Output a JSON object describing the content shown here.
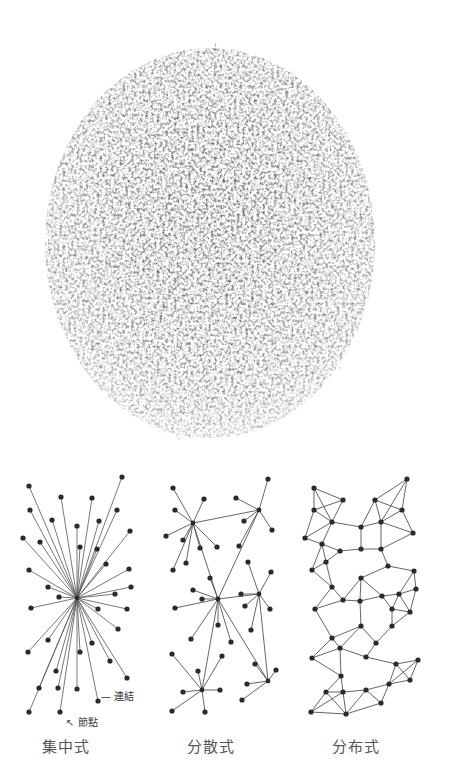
{
  "labels": {
    "centralized": "集中式",
    "decentralized": "分散式",
    "distributed": "分布式",
    "link": "連結",
    "node": "節點"
  },
  "colors": {
    "node": "#2a2a2a",
    "edge": "#555555",
    "cloud_dark": "#333333",
    "cloud_light": "#9a9a9a",
    "label": "#555555"
  },
  "centralized": {
    "hub": [
      77,
      598
    ],
    "nodes": [
      [
        29,
        486
      ],
      [
        61,
        497
      ],
      [
        92,
        498
      ],
      [
        122,
        477
      ],
      [
        30,
        510
      ],
      [
        52,
        520
      ],
      [
        99,
        521
      ],
      [
        117,
        510
      ],
      [
        23,
        538
      ],
      [
        40,
        542
      ],
      [
        77,
        526
      ],
      [
        80,
        547
      ],
      [
        130,
        531
      ],
      [
        97,
        549
      ],
      [
        106,
        564
      ],
      [
        29,
        570
      ],
      [
        48,
        587
      ],
      [
        59,
        597
      ],
      [
        129,
        569
      ],
      [
        131,
        587
      ],
      [
        115,
        594
      ],
      [
        31,
        608
      ],
      [
        98,
        609
      ],
      [
        127,
        609
      ],
      [
        118,
        629
      ],
      [
        48,
        640
      ],
      [
        28,
        652
      ],
      [
        80,
        652
      ],
      [
        92,
        643
      ],
      [
        110,
        661
      ],
      [
        56,
        671
      ],
      [
        127,
        678
      ],
      [
        39,
        688
      ],
      [
        58,
        688
      ],
      [
        77,
        689
      ],
      [
        98,
        701
      ],
      [
        29,
        712
      ],
      [
        60,
        712
      ]
    ]
  },
  "decentralized": {
    "hubs": [
      [
        193,
        523
      ],
      [
        259,
        510
      ],
      [
        218,
        599
      ],
      [
        259,
        594
      ],
      [
        268,
        681
      ],
      [
        202,
        690
      ]
    ],
    "nodes": [
      [
        173,
        488
      ],
      [
        204,
        499
      ],
      [
        175,
        510
      ],
      [
        236,
        498
      ],
      [
        268,
        479
      ],
      [
        166,
        536
      ],
      [
        183,
        540
      ],
      [
        200,
        548
      ],
      [
        217,
        547
      ],
      [
        244,
        521
      ],
      [
        272,
        530
      ],
      [
        239,
        546
      ],
      [
        173,
        570
      ],
      [
        186,
        563
      ],
      [
        210,
        578
      ],
      [
        248,
        562
      ],
      [
        271,
        572
      ],
      [
        193,
        590
      ],
      [
        202,
        599
      ],
      [
        175,
        608
      ],
      [
        241,
        594
      ],
      [
        245,
        606
      ],
      [
        270,
        609
      ],
      [
        218,
        625
      ],
      [
        251,
        630
      ],
      [
        191,
        639
      ],
      [
        231,
        642
      ],
      [
        172,
        654
      ],
      [
        222,
        656
      ],
      [
        198,
        671
      ],
      [
        255,
        664
      ],
      [
        276,
        670
      ],
      [
        183,
        692
      ],
      [
        220,
        690
      ],
      [
        247,
        684
      ],
      [
        172,
        711
      ],
      [
        205,
        712
      ],
      [
        242,
        700
      ]
    ],
    "edges": [
      [
        0,
        "n0"
      ],
      [
        0,
        "n1"
      ],
      [
        0,
        "n2"
      ],
      [
        0,
        "n5"
      ],
      [
        0,
        "n6"
      ],
      [
        0,
        "n7"
      ],
      [
        0,
        "n8"
      ],
      [
        1,
        "n3"
      ],
      [
        1,
        "n4"
      ],
      [
        1,
        "n9"
      ],
      [
        1,
        "n10"
      ],
      [
        0,
        1
      ],
      [
        0,
        2
      ],
      [
        1,
        2
      ],
      [
        1,
        "n11"
      ]
    ]
  },
  "distributed": {
    "nodes": [
      [
        314,
        488
      ],
      [
        343,
        500
      ],
      [
        375,
        500
      ],
      [
        407,
        479
      ],
      [
        314,
        510
      ],
      [
        332,
        522
      ],
      [
        361,
        527
      ],
      [
        381,
        522
      ],
      [
        402,
        510
      ],
      [
        305,
        538
      ],
      [
        322,
        544
      ],
      [
        340,
        551
      ],
      [
        361,
        549
      ],
      [
        381,
        549
      ],
      [
        413,
        533
      ],
      [
        312,
        570
      ],
      [
        326,
        562
      ],
      [
        361,
        578
      ],
      [
        388,
        566
      ],
      [
        414,
        571
      ],
      [
        332,
        587
      ],
      [
        360,
        601
      ],
      [
        382,
        596
      ],
      [
        399,
        594
      ],
      [
        416,
        589
      ],
      [
        315,
        609
      ],
      [
        343,
        600
      ],
      [
        392,
        609
      ],
      [
        410,
        612
      ],
      [
        332,
        638
      ],
      [
        361,
        626
      ],
      [
        376,
        643
      ],
      [
        392,
        626
      ],
      [
        312,
        658
      ],
      [
        340,
        648
      ],
      [
        366,
        657
      ],
      [
        396,
        664
      ],
      [
        418,
        660
      ],
      [
        341,
        676
      ],
      [
        389,
        684
      ],
      [
        410,
        680
      ],
      [
        326,
        692
      ],
      [
        343,
        692
      ],
      [
        366,
        690
      ],
      [
        381,
        703
      ],
      [
        311,
        712
      ],
      [
        346,
        714
      ]
    ]
  },
  "cloud": {
    "cx": 210,
    "cy": 243,
    "rx": 165,
    "ry": 195
  }
}
